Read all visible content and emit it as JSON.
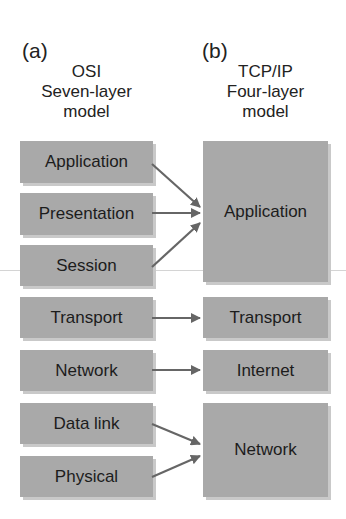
{
  "panels": {
    "a": {
      "label": "(a)",
      "title_lines": [
        "OSI",
        "Seven-layer",
        "model"
      ],
      "layers": [
        "Application",
        "Presentation",
        "Session",
        "Transport",
        "Network",
        "Data link",
        "Physical"
      ]
    },
    "b": {
      "label": "(b)",
      "title_lines": [
        "TCP/IP",
        "Four-layer",
        "model"
      ],
      "layers": [
        "Application",
        "Transport",
        "Internet",
        "Network"
      ]
    }
  },
  "mappings": [
    {
      "from": "Application",
      "to": "Application"
    },
    {
      "from": "Presentation",
      "to": "Application"
    },
    {
      "from": "Session",
      "to": "Application"
    },
    {
      "from": "Transport",
      "to": "Transport"
    },
    {
      "from": "Network",
      "to": "Internet"
    },
    {
      "from": "Data link",
      "to": "Network"
    },
    {
      "from": "Physical",
      "to": "Network"
    }
  ],
  "colors": {
    "box": "#a9a9a9",
    "arrow": "#666666"
  }
}
